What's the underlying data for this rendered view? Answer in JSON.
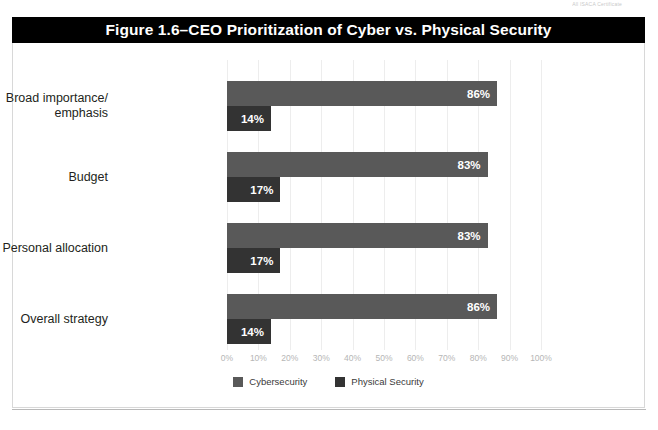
{
  "page": {
    "header_note": "All ISACA Certificate"
  },
  "figure": {
    "title": "Figure 1.6–CEO Prioritization of Cyber vs. Physical Security"
  },
  "chart_data": {
    "type": "bar",
    "orientation": "horizontal",
    "title": "Figure 1.6–CEO Prioritization of Cyber vs. Physical Security",
    "xlabel": "",
    "ylabel": "",
    "xlim": [
      0,
      100
    ],
    "grid": true,
    "legend_position": "bottom-center",
    "categories": [
      "Broad importance/ emphasis",
      "Budget",
      "Personal allocation",
      "Overall strategy"
    ],
    "category_lines": [
      [
        "Broad importance/",
        "emphasis"
      ],
      [
        "Budget",
        ""
      ],
      [
        "Personal allocation",
        ""
      ],
      [
        "Overall strategy",
        ""
      ]
    ],
    "tick_labels": [
      "0%",
      "10%",
      "20%",
      "30%",
      "40%",
      "50%",
      "60%",
      "70%",
      "80%",
      "90%",
      "100%"
    ],
    "tick_values": [
      0,
      10,
      20,
      30,
      40,
      50,
      60,
      70,
      80,
      90,
      100
    ],
    "series": [
      {
        "name": "Cybersecurity",
        "color": "#595959",
        "values": [
          86,
          83,
          83,
          86
        ],
        "labels": [
          "86%",
          "83%",
          "83%",
          "86%"
        ]
      },
      {
        "name": "Physical Security",
        "color": "#333333",
        "values": [
          14,
          17,
          17,
          14
        ],
        "labels": [
          "14%",
          "17%",
          "17%",
          "14%"
        ]
      }
    ]
  },
  "colors": {
    "title_bar": "#000000",
    "title_text": "#ffffff",
    "cyber": "#595959",
    "physical": "#333333",
    "gridline": "#ededed",
    "tick_text": "#b6b6b6"
  }
}
